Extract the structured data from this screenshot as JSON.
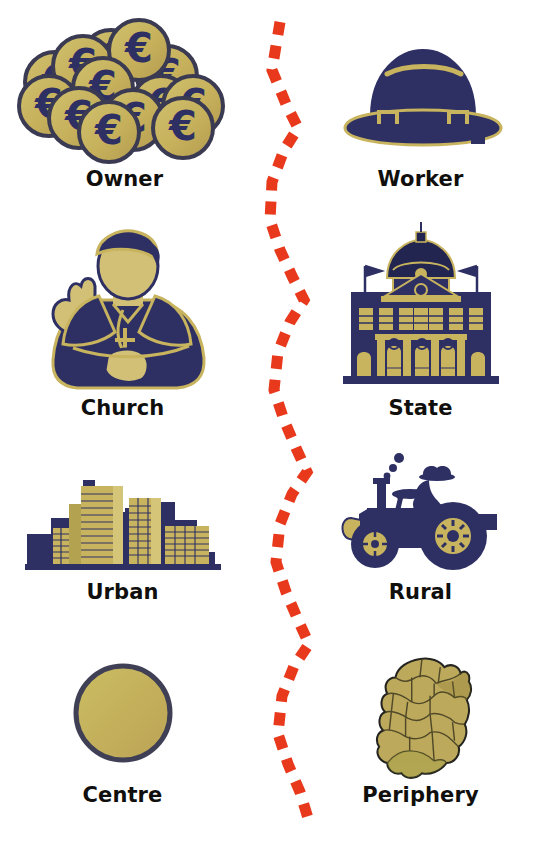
{
  "diagram": {
    "type": "paired-concept-diagram",
    "background_color": "#ffffff",
    "divider": {
      "name": "red-zigzag-dashed-line",
      "color": "#e8391c",
      "style": "dashed",
      "orientation": "vertical",
      "shape": "zigzag"
    },
    "palette": {
      "navy": "#2e3064",
      "navy_dark": "#232551",
      "gold": "#c8b45e",
      "gold_light": "#d5c578",
      "olive": "#b3a24f",
      "red": "#e8391c",
      "text": "#100f0d",
      "outline": "#3a3a52"
    },
    "rows": [
      {
        "id": "owner-worker",
        "left": {
          "label": "Owner",
          "icon": "euro-coins-icon"
        },
        "right": {
          "label": "Worker",
          "icon": "hard-hat-icon"
        }
      },
      {
        "id": "church-state",
        "left": {
          "label": "Church",
          "icon": "bishop-icon"
        },
        "right": {
          "label": "State",
          "icon": "parliament-building-icon"
        }
      },
      {
        "id": "urban-rural",
        "left": {
          "label": "Urban",
          "icon": "city-skyline-icon"
        },
        "right": {
          "label": "Rural",
          "icon": "tractor-icon"
        }
      },
      {
        "id": "centre-periphery",
        "left": {
          "label": "Centre",
          "icon": "filled-circle-icon"
        },
        "right": {
          "label": "Periphery",
          "icon": "ireland-map-icon"
        }
      }
    ]
  }
}
